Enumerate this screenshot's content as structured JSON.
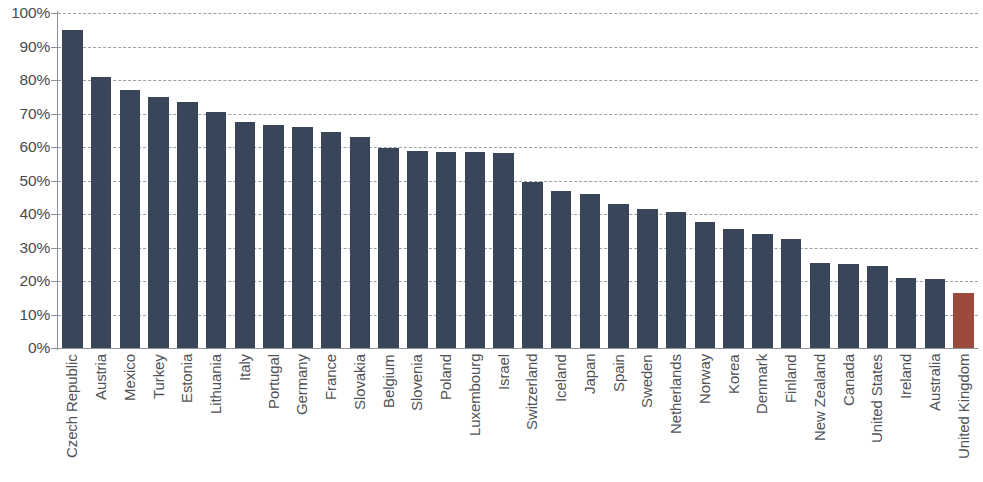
{
  "chart_data": {
    "type": "bar",
    "title": "",
    "subtitle": "",
    "xlabel": "",
    "ylabel": "",
    "ylim": [
      0,
      100
    ],
    "grid": true,
    "legend": "none",
    "y_tick_labels": [
      "100%",
      "90%",
      "80%",
      "70%",
      "60%",
      "50%",
      "40%",
      "30%",
      "20%",
      "10%",
      "0%"
    ],
    "y_tick_values": [
      100,
      90,
      80,
      70,
      60,
      50,
      40,
      30,
      20,
      10,
      0
    ],
    "value_suffix": "%",
    "categories": [
      "Czech Republic",
      "Austria",
      "Mexico",
      "Turkey",
      "Estonia",
      "Lithuania",
      "Italy",
      "Portugal",
      "Germany",
      "France",
      "Slovakia",
      "Belgium",
      "Slovenia",
      "Poland",
      "Luxembourg",
      "Israel",
      "Switzerland",
      "Iceland",
      "Japan",
      "Spain",
      "Sweden",
      "Netherlands",
      "Norway",
      "Korea",
      "Denmark",
      "Finland",
      "New Zealand",
      "Canada",
      "United States",
      "Ireland",
      "Australia",
      "United Kingdom"
    ],
    "values": [
      95,
      81,
      77,
      75,
      73.5,
      70.5,
      67.5,
      66.5,
      66,
      64.5,
      63,
      59.8,
      58.8,
      58.5,
      58.5,
      58.3,
      49.5,
      47,
      46,
      43,
      41.5,
      40.5,
      37.5,
      35.5,
      34,
      32.5,
      25.5,
      25,
      24.5,
      21,
      20.5,
      16.5
    ],
    "highlight_category": "United Kingdom",
    "highlight_index": 31,
    "colors": {
      "bar": "#39465a",
      "highlight_bar": "#9c4a3c",
      "gridline": "#9aa0a6",
      "axis": "#8d9298",
      "tick_label": "#4a4a4a",
      "category_label": "#4f5256",
      "background": "#ffffff"
    }
  }
}
